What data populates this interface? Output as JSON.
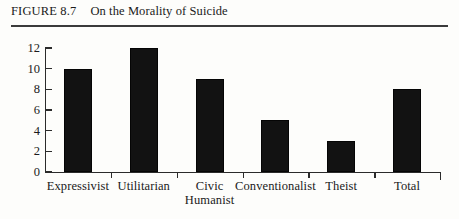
{
  "figure": {
    "number": "FIGURE 8.7",
    "title": "On the Morality of Suicide"
  },
  "chart_data": {
    "type": "bar",
    "title": "On the Morality of Suicide",
    "categories": [
      "Expressivist",
      "Utilitarian",
      "Civic Humanist",
      "Conventionalist",
      "Theist",
      "Total"
    ],
    "category_lines": [
      [
        "Expressivist"
      ],
      [
        "Utilitarian"
      ],
      [
        "Civic",
        "Humanist"
      ],
      [
        "Conventionalist"
      ],
      [
        "Theist"
      ],
      [
        "Total"
      ]
    ],
    "values": [
      10,
      12,
      9,
      5,
      3,
      8
    ],
    "xlabel": "",
    "ylabel": "",
    "ylim": [
      0,
      12
    ],
    "yticks": [
      0,
      2,
      4,
      6,
      8,
      10,
      12
    ],
    "ytick_labels": [
      "0",
      "2",
      "4",
      "6",
      "8",
      "10",
      "12"
    ],
    "grid": false,
    "legend": false,
    "bar_color": "#121212",
    "axis_color": "#2b2b2b",
    "background_color": "#fdfdfb"
  }
}
